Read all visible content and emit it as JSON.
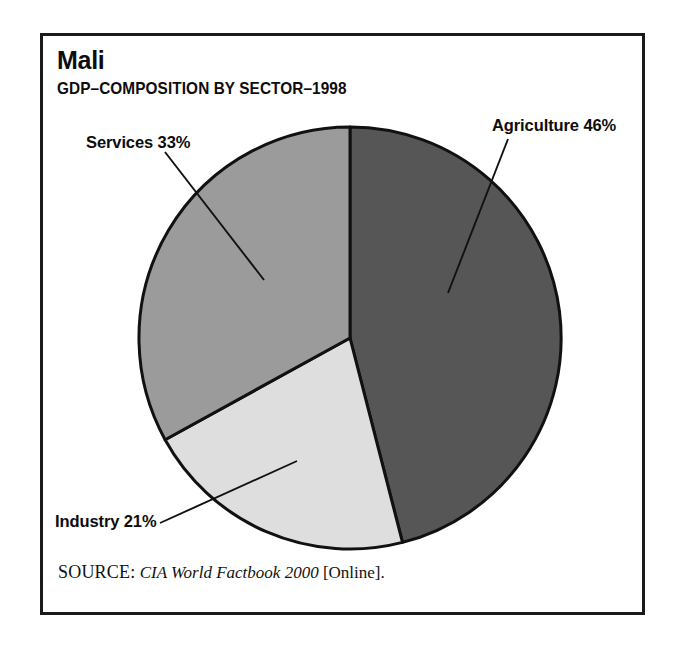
{
  "figure": {
    "title": "Mali",
    "subtitle": "GDP–COMPOSITION BY SECTOR–1998",
    "frame_border_color": "#1a1a1a"
  },
  "source": {
    "label": "SOURCE:",
    "work": "CIA World Factbook 2000",
    "medium": "[Online].",
    "trailing": ""
  },
  "labels": {
    "agriculture": "Agriculture 46%",
    "services": "Services 33%",
    "industry": "Industry 21%"
  },
  "chart_data": {
    "type": "pie",
    "title": "Mali",
    "subtitle": "GDP–COMPOSITION BY SECTOR–1998",
    "xlabel": "",
    "ylabel": "",
    "units": "percent",
    "total": 100,
    "start_angle_deg": 0,
    "direction": "clockwise",
    "legend": "none-inline-labels",
    "grid": false,
    "categories": [
      "Agriculture",
      "Industry",
      "Services"
    ],
    "values": [
      46,
      21,
      33
    ],
    "slices": [
      {
        "name": "Agriculture",
        "value": 46,
        "label": "Agriculture 46%",
        "color": "#565656",
        "start_deg": 0,
        "end_deg": 165.6
      },
      {
        "name": "Industry",
        "value": 21,
        "label": "Industry 21%",
        "color": "#dedede",
        "start_deg": 165.6,
        "end_deg": 241.2
      },
      {
        "name": "Services",
        "value": 33,
        "label": "Services 33%",
        "color": "#9b9b9b",
        "start_deg": 241.2,
        "end_deg": 360
      }
    ],
    "annotations": [
      {
        "text": "Agriculture 46%",
        "target_slice": "Agriculture"
      },
      {
        "text": "Services 33%",
        "target_slice": "Services"
      },
      {
        "text": "Industry 21%",
        "target_slice": "Industry"
      }
    ]
  },
  "geometry": {
    "center_x": 350,
    "center_y": 338,
    "radius": 211
  }
}
